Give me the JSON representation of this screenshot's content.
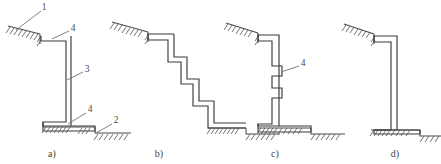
{
  "figure": {
    "stroke_color": "#3a3a3a",
    "ground_color": "#4a4a4a",
    "hatch_color": "#5a5a5a",
    "leader_color": "#6b6b6b",
    "background": "#ffffff"
  },
  "panels": [
    {
      "id": "a",
      "caption": "a)",
      "caption_x": 52,
      "caption_y": 157,
      "description": "Single offset wall with top and bottom ledges",
      "callouts": [
        {
          "label": "1",
          "x": 44,
          "y": 8,
          "leader": "M 41 11 L 16 30"
        },
        {
          "label": "4",
          "x": 73,
          "y": 29,
          "leader": "M 69 31 L 52 38"
        },
        {
          "label": "3",
          "x": 87,
          "y": 70,
          "leader": "M 83 72 L 67 79"
        },
        {
          "label": "4",
          "x": 90,
          "y": 110,
          "leader": "M 86 113 L 69 121"
        },
        {
          "label": "2",
          "x": 116,
          "y": 121,
          "leader": "M 112 124 L 95 133"
        }
      ]
    },
    {
      "id": "b",
      "caption": "b)",
      "caption_x": 159,
      "caption_y": 157,
      "description": "Stepped wall descending in four steps",
      "callouts": []
    },
    {
      "id": "c",
      "caption": "c)",
      "caption_x": 275,
      "caption_y": 157,
      "description": "Wall with keyed notches on the face",
      "callouts": [
        {
          "label": "4",
          "x": 303,
          "y": 64,
          "leader": "M 299 66 L 282 73"
        }
      ]
    },
    {
      "id": "d",
      "caption": "d)",
      "caption_x": 395,
      "caption_y": 157,
      "description": "Plain vertical wall with single top offset",
      "callouts": []
    }
  ],
  "geometry": {
    "panel_a": {
      "wall_path": "M 40 36 L 40 41 L 67 41 L 67 121 L 40 121 L 40 126 L 96 126 L 96 121 L 72 121 L 72 41 L 72 36 Z",
      "wall_path_simple": "M 41 36 L 41 42 L 66 42 L 66 120 L 43 120 L 43 131 L 95 131 L 95 126 L 71 126 L 71 36",
      "ground_segments": [
        {
          "d": "M 6 29 L 44 29",
          "slope": true
        },
        {
          "d": "M 43 131 L 95 131"
        },
        {
          "d": "M 95 133 L 131 133"
        }
      ]
    },
    "panel_b": {
      "wall_path": "M 148 34 L 148 40 L 168 40 L 168 62 L 180 62 L 180 84 L 192 84 L 192 106 L 207 106 L 207 128 L 245 128 L 245 122 L 213 122 L 213 100 L 198 100 L 198 78 L 186 78 L 186 56 L 174 56 L 174 34",
      "ground_segments": [
        {
          "d": "M 112 27 L 150 27"
        },
        {
          "d": "M 205 128 L 246 128"
        },
        {
          "d": "M 246 131 L 278 131"
        }
      ]
    },
    "panel_c": {
      "wall_path": "M 258 34 L 258 40 L 278 40 L 278 128 L 258 128 L 258 134 L 310 134 L 310 128 L 285 128 L 285 34",
      "notches": [
        {
          "d": "M 278 66 L 288 66 L 288 76 L 278 76"
        },
        {
          "d": "M 278 88 L 288 88 L 288 98 L 278 98"
        }
      ],
      "ground_segments": [
        {
          "d": "M 228 28 L 262 28"
        },
        {
          "d": "M 256 134 L 310 134"
        },
        {
          "d": "M 310 137 L 344 137"
        }
      ]
    },
    "panel_d": {
      "wall_path": "M 372 36 L 372 42 L 388 42 L 388 128 L 372 128 L 372 134 L 420 134 L 420 128 L 396 128 L 396 36",
      "ground_segments": [
        {
          "d": "M 344 28 L 376 28"
        },
        {
          "d": "M 368 134 L 418 134"
        },
        {
          "d": "M 418 137 L 441 137"
        }
      ]
    }
  }
}
